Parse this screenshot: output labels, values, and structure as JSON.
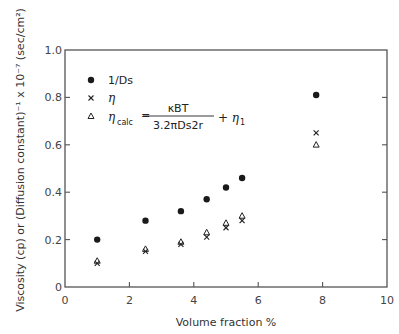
{
  "chart_data": {
    "type": "scatter",
    "title": "",
    "xlabel": "Volume fraction  %",
    "ylabel": "Viscosity (cp) or (Diffusion constant)⁻¹ x 10⁻⁷ (sec/cm²)",
    "xlim": [
      0,
      10
    ],
    "ylim": [
      0,
      1.0
    ],
    "x_ticks": [
      "0",
      "2",
      "4",
      "6",
      "8",
      "10"
    ],
    "y_ticks": [
      "0",
      "0.2",
      "0.4",
      "0.6",
      "0.8",
      "1.0"
    ],
    "grid": false,
    "legend_position": "upper left (inside)",
    "x": [
      1.0,
      2.5,
      3.6,
      4.4,
      5.0,
      5.5,
      7.8
    ],
    "series": [
      {
        "name": "1/Ds",
        "marker": "filled-circle",
        "values": [
          0.2,
          0.28,
          0.32,
          0.37,
          0.42,
          0.46,
          0.81
        ]
      },
      {
        "name": "η",
        "marker": "x",
        "values": [
          0.1,
          0.15,
          0.18,
          0.21,
          0.25,
          0.28,
          0.65
        ]
      },
      {
        "name": "ηcalc = κBT / (3.2π Ds2 r) + η1",
        "marker": "open-triangle",
        "values": [
          0.11,
          0.16,
          0.19,
          0.23,
          0.27,
          0.3,
          0.6
        ]
      }
    ]
  },
  "legend": {
    "item1": "1/Ds",
    "item2": "η",
    "item3_lhs": "η",
    "item3_sub": "calc",
    "item3_eq": "=",
    "item3_num": "κBT",
    "item3_den": "3.2πDs2r",
    "item3_plus": "+ η",
    "item3_plus_sub": "1"
  },
  "axes": {
    "xlabel": "Volume fraction  %",
    "ylabel": "Viscosity (cp) or (Diffusion constant)⁻¹ x 10⁻⁷ (sec/cm²)",
    "x_tick_labels": [
      "0",
      "2",
      "4",
      "6",
      "8",
      "10"
    ],
    "y_tick_labels": [
      "0",
      "0.2",
      "0.4",
      "0.6",
      "0.8",
      "1.0"
    ]
  }
}
